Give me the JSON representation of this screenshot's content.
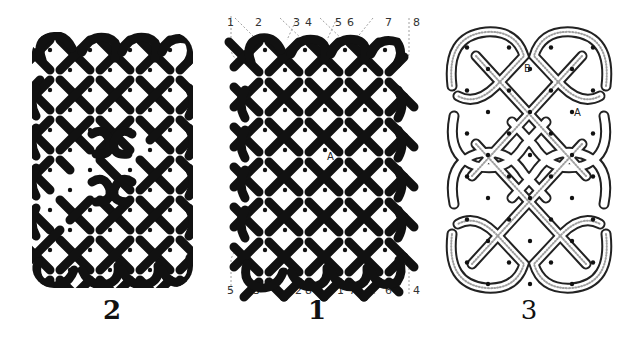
{
  "figures": [
    {
      "id": "fig2",
      "caption": "2",
      "style": "solid-black-interlace",
      "description": "Knot panel with two inner loop breaks"
    },
    {
      "id": "fig1",
      "caption": "1",
      "style": "solid-black-interlace",
      "description": "Plain plait panel with numbered guide lines",
      "point_label": "A",
      "top_labels": [
        "1",
        "2",
        "3",
        "4",
        "5",
        "6",
        "7",
        "8"
      ],
      "bottom_labels": [
        "5",
        "3",
        "2",
        "8",
        "1",
        "7",
        "6",
        "4"
      ]
    },
    {
      "id": "fig3",
      "caption": "3",
      "style": "shaded-ribbon-interlace",
      "description": "Curved ribbon knot panel",
      "point_labels": [
        "B",
        "A"
      ]
    }
  ],
  "colors": {
    "ink": "#111111",
    "paper": "#ffffff",
    "shade": "#777777",
    "guide": "#888888"
  }
}
